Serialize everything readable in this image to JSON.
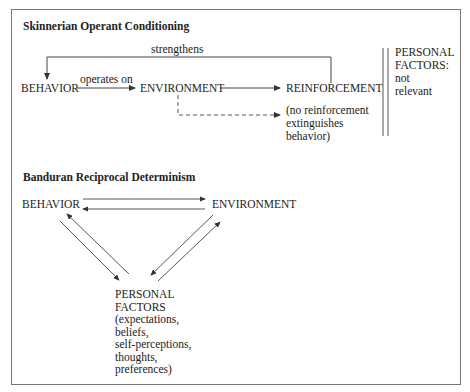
{
  "skinner": {
    "title": "Skinnerian Operant Conditioning",
    "edge_strengthens": "strengthens",
    "edge_operates_on": "operates on",
    "node_behavior": "BEHAVIOR",
    "node_environment": "ENVIRONMENT",
    "node_reinforcement": "REINFORCEMENT",
    "no_reinforcement_note": "(no reinforcement\nextinguishes\nbehavior)",
    "personal_factors": "PERSONAL\nFACTORS:\nnot\nrelevant"
  },
  "bandura": {
    "title": "Banduran Reciprocal Determinism",
    "node_behavior": "BEHAVIOR",
    "node_environment": "ENVIRONMENT",
    "node_personal_factors": "PERSONAL\nFACTORS\n(expectations,\nbeliefs,\nself-perceptions,\nthoughts,\npreferences)"
  },
  "colors": {
    "line": "#444444",
    "frame": "#777777",
    "text": "#222222"
  }
}
